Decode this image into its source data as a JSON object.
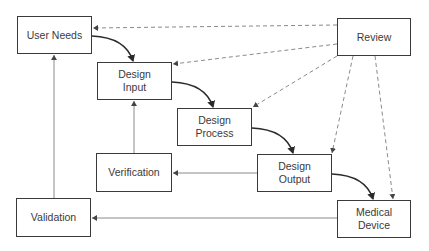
{
  "diagram": {
    "nodes": [
      {
        "id": "user-needs",
        "label": "User Needs",
        "x": 17,
        "y": 16,
        "w": 75,
        "h": 38
      },
      {
        "id": "design-input",
        "label": "Design\nInput",
        "x": 97,
        "y": 62,
        "w": 75,
        "h": 38
      },
      {
        "id": "design-process",
        "label": "Design\nProcess",
        "x": 177,
        "y": 108,
        "w": 75,
        "h": 38
      },
      {
        "id": "design-output",
        "label": "Design\nOutput",
        "x": 257,
        "y": 154,
        "w": 75,
        "h": 38
      },
      {
        "id": "medical-device",
        "label": "Medical\nDevice",
        "x": 337,
        "y": 200,
        "w": 74,
        "h": 38
      },
      {
        "id": "review",
        "label": "Review",
        "x": 337,
        "y": 18,
        "w": 74,
        "h": 38
      },
      {
        "id": "verification",
        "label": "Verification",
        "x": 96,
        "y": 153,
        "w": 76,
        "h": 39
      },
      {
        "id": "validation",
        "label": "Validation",
        "x": 16,
        "y": 198,
        "w": 75,
        "h": 39
      }
    ],
    "edges": [
      {
        "from": "user-needs",
        "to": "design-input",
        "style": "curved-solid"
      },
      {
        "from": "design-input",
        "to": "design-process",
        "style": "curved-solid"
      },
      {
        "from": "design-process",
        "to": "design-output",
        "style": "curved-solid"
      },
      {
        "from": "design-output",
        "to": "medical-device",
        "style": "curved-solid"
      },
      {
        "from": "review",
        "to": "user-needs",
        "style": "dashed"
      },
      {
        "from": "review",
        "to": "design-input",
        "style": "dashed"
      },
      {
        "from": "review",
        "to": "design-process",
        "style": "dashed"
      },
      {
        "from": "review",
        "to": "design-output",
        "style": "dashed"
      },
      {
        "from": "review",
        "to": "medical-device",
        "style": "dashed"
      },
      {
        "from": "design-output",
        "to": "verification",
        "style": "thin-solid"
      },
      {
        "from": "verification",
        "to": "design-input",
        "style": "thin-solid"
      },
      {
        "from": "medical-device",
        "to": "validation",
        "style": "thin-solid"
      },
      {
        "from": "validation",
        "to": "user-needs",
        "style": "thin-solid"
      }
    ],
    "colors": {
      "box_border": "#3a3a3a",
      "curve": "#2a2a2a",
      "thin": "#8a8a8a",
      "dashed": "#8a8a8a"
    }
  }
}
